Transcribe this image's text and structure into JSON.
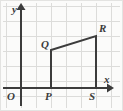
{
  "figure": {
    "background_color": "#fbfbfa",
    "grid_color": "#dcdcda",
    "axis_color": "#3c3c3c",
    "shape_color": "#3c3c3c",
    "border_color": "#e3e3e1",
    "grid_spacing": 15,
    "grid_origin": {
      "x": 6,
      "y": 6
    }
  },
  "axes": {
    "x_axis": {
      "label": "x",
      "label_x": 104,
      "label_y": 74,
      "y_pixel": 88,
      "start_x": 3,
      "end_x": 112,
      "arrow": "right"
    },
    "y_axis": {
      "label": "y",
      "label_x": 12,
      "label_y": 4,
      "x_pixel": 21,
      "start_y": 106,
      "end_y": 5,
      "arrow": "up"
    },
    "origin": {
      "label": "O",
      "label_x": 7,
      "label_y": 91
    }
  },
  "shape": {
    "name": "trapezoid",
    "vertices": [
      {
        "id": "P",
        "x": 51,
        "y": 88,
        "label": "P",
        "label_x": 45,
        "label_y": 91
      },
      {
        "id": "Q",
        "x": 51,
        "y": 50,
        "label": "Q",
        "label_x": 41,
        "label_y": 39
      },
      {
        "id": "R",
        "x": 96,
        "y": 36,
        "label": "R",
        "label_x": 99,
        "label_y": 23
      },
      {
        "id": "S",
        "x": 96,
        "y": 88,
        "label": "S",
        "label_x": 89,
        "label_y": 91
      }
    ],
    "path": "M51,88 L51,50 L96,36 L96,88 Z",
    "stroke_width": 2
  },
  "grid_lines": {
    "vertical_x": [
      6,
      21,
      36,
      51,
      66,
      81,
      96,
      111
    ],
    "horizontal_y": [
      6,
      21,
      36,
      51,
      66,
      81,
      96
    ]
  }
}
